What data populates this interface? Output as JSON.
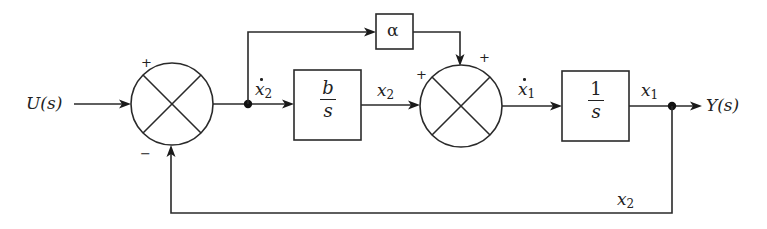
{
  "diagram": {
    "type": "block-diagram",
    "input": {
      "label": "U(s)"
    },
    "output": {
      "label": "Y(s)"
    },
    "blocks": [
      {
        "id": "alpha",
        "label": "α"
      },
      {
        "id": "integrator_b",
        "numerator": "b",
        "denominator": "s"
      },
      {
        "id": "integrator_1",
        "numerator": "1",
        "denominator": "s"
      }
    ],
    "summing_junctions": [
      {
        "id": "sum1",
        "signs": {
          "left": "+",
          "bottom": "−"
        }
      },
      {
        "id": "sum2",
        "signs": {
          "left": "+",
          "top": "+"
        }
      }
    ],
    "signal_labels": {
      "x2_dot": {
        "var": "x",
        "sub": "2"
      },
      "x2": {
        "var": "x",
        "sub": "2"
      },
      "x1_dot": {
        "var": "x",
        "sub": "1"
      },
      "x1": {
        "var": "x",
        "sub": "1"
      },
      "feedback_x2": {
        "var": "x",
        "sub": "2"
      }
    },
    "connections": [
      "U(s) → sum1 (+)",
      "sum1 → node ẋ2",
      "ẋ2 → b/s → x2 → sum2 (+)",
      "ẋ2 → α → sum2 (+)",
      "sum2 → ẋ1 → 1/s → x1 → node → Y(s)",
      "node → feedback x2 → sum1 (−)"
    ],
    "colors": {
      "stroke": "#2a2a2a",
      "background": "#ffffff"
    }
  }
}
